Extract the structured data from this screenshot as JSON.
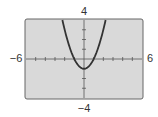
{
  "chart_data": {
    "type": "line",
    "title": "",
    "xlabel": "",
    "ylabel": "",
    "xlim": [
      -6,
      6
    ],
    "ylim": [
      -4,
      4
    ],
    "grid": false,
    "function": "x^2 - 1",
    "x_tick_step": 1,
    "y_tick_step": 1,
    "window_labels": {
      "xmin": "−6",
      "xmax": "6",
      "ymin": "−4",
      "ymax": "4"
    },
    "series": [
      {
        "name": "y = x^2 - 1",
        "x": [
          -2.236,
          -2,
          -1.5,
          -1,
          -0.5,
          0,
          0.5,
          1,
          1.5,
          2,
          2.236
        ],
        "y": [
          4,
          3,
          1.25,
          0,
          -0.75,
          -1,
          -0.75,
          0,
          1.25,
          3,
          4
        ]
      }
    ],
    "colors": {
      "background": "#d9d9d9",
      "frame": "#666666",
      "curve": "#333333",
      "axis": "#555555"
    }
  }
}
